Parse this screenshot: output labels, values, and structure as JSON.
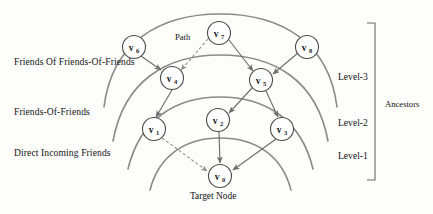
{
  "figure": {
    "type": "layered-graph-diagram",
    "width": 433,
    "height": 214,
    "background": "#fdfdfc",
    "stroke_color": "#6e6e6e",
    "arc_color": "#8a8a8a",
    "node_fill": "#ffffff",
    "node_stroke": "#4a4a4a"
  },
  "nodes": [
    {
      "id": "v0",
      "label": "v",
      "sub": "0",
      "cx": 220,
      "cy": 176,
      "r": 11.5
    },
    {
      "id": "v1",
      "label": "v",
      "sub": "1",
      "cx": 154,
      "cy": 129,
      "r": 11.5
    },
    {
      "id": "v2",
      "label": "v",
      "sub": "2",
      "cx": 218,
      "cy": 120,
      "r": 11.5
    },
    {
      "id": "v3",
      "label": "v",
      "sub": "3",
      "cx": 282,
      "cy": 129,
      "r": 11.5
    },
    {
      "id": "v4",
      "label": "v",
      "sub": "4",
      "cx": 172,
      "cy": 78,
      "r": 11.5
    },
    {
      "id": "v5",
      "label": "v",
      "sub": "5",
      "cx": 261,
      "cy": 80,
      "r": 11.5
    },
    {
      "id": "v6",
      "label": "v",
      "sub": "6",
      "cx": 134,
      "cy": 47,
      "r": 11.5
    },
    {
      "id": "v7",
      "label": "v",
      "sub": "7",
      "cx": 219,
      "cy": 33,
      "r": 11.5
    },
    {
      "id": "v8",
      "label": "v",
      "sub": "8",
      "cx": 307,
      "cy": 47,
      "r": 11.5
    }
  ],
  "edges": [
    {
      "from": "v6",
      "to": "v4",
      "style": "solid",
      "arrow": true
    },
    {
      "from": "v7",
      "to": "v4",
      "style": "dashed",
      "arrow": true
    },
    {
      "from": "v7",
      "to": "v5",
      "style": "solid",
      "arrow": true
    },
    {
      "from": "v8",
      "to": "v5",
      "style": "solid",
      "arrow": true
    },
    {
      "from": "v4",
      "to": "v1",
      "style": "solid",
      "arrow": true
    },
    {
      "from": "v5",
      "to": "v2",
      "style": "solid",
      "arrow": true
    },
    {
      "from": "v5",
      "to": "v3",
      "style": "solid",
      "arrow": true
    },
    {
      "from": "v1",
      "to": "v0",
      "style": "dashed",
      "arrow": true
    },
    {
      "from": "v2",
      "to": "v0",
      "style": "solid",
      "arrow": true
    },
    {
      "from": "v3",
      "to": "v0",
      "style": "solid",
      "arrow": true
    }
  ],
  "arcs": [
    {
      "name": "arc-outer",
      "level": "level-3-outer"
    },
    {
      "name": "arc-level3",
      "level": "level-3-inner"
    },
    {
      "name": "arc-level2",
      "level": "level-2"
    },
    {
      "name": "arc-level1",
      "level": "level-1"
    }
  ],
  "left_labels": [
    {
      "id": "friends-of-friends-of-friends",
      "text": "Friends Of Friends-Of-Friends",
      "x": 14,
      "y": 63
    },
    {
      "id": "friends-of-friends",
      "text": "Friends-Of-Friends",
      "x": 14,
      "y": 113
    },
    {
      "id": "direct-incoming-friends",
      "text": "Direct Incoming Friends",
      "x": 14,
      "y": 154
    }
  ],
  "level_labels": [
    {
      "id": "level-3",
      "text": "Level-3",
      "x": 338,
      "y": 78
    },
    {
      "id": "level-2",
      "text": "Level-2",
      "x": 338,
      "y": 124
    },
    {
      "id": "level-1",
      "text": "Level-1",
      "x": 338,
      "y": 157
    }
  ],
  "annotations": {
    "path": {
      "text": "Path",
      "x": 175,
      "y": 38
    },
    "ancestors": {
      "text": "Ancestors",
      "x": 385,
      "y": 104
    },
    "target_node": {
      "text": "Target Node",
      "x": 190,
      "y": 192
    }
  },
  "bracket": {
    "x": 375,
    "y_top": 23,
    "y_bottom": 180,
    "tick": 8
  }
}
